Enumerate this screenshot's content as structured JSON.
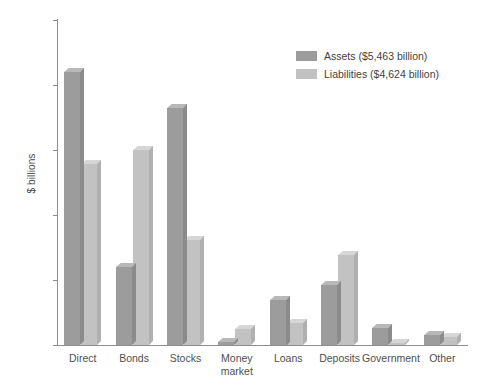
{
  "chart_data": {
    "type": "bar",
    "title": "",
    "xlabel": "",
    "ylabel": "$ billions",
    "ylim": [
      0,
      2500
    ],
    "yticks": [
      0,
      500,
      1000,
      1500,
      2000,
      2500
    ],
    "ytick_labels": [
      "0",
      "500",
      "1000",
      "1500",
      "2000",
      "2500"
    ],
    "grid": false,
    "legend_position": "upper-right-inside",
    "categories": [
      "Direct",
      "Bonds",
      "Stocks",
      "Money\nmarket",
      "Loans",
      "Deposits",
      "Government",
      "Other"
    ],
    "category_labels": [
      "Direct",
      "Bonds",
      "Stocks",
      "Money market",
      "Loans",
      "Deposits",
      "Government",
      "Other"
    ],
    "series": [
      {
        "name": "Assets ($5,463 billion)",
        "short_name": "Assets",
        "total": "$5,463 billion",
        "color": "#9c9c9c",
        "values": [
          2100,
          600,
          1820,
          20,
          350,
          460,
          130,
          80
        ]
      },
      {
        "name": "Liabilities ($4,624 billion)",
        "short_name": "Liabilities",
        "total": "$4,624 billion",
        "color": "#c2c2c2",
        "values": [
          1390,
          1500,
          810,
          120,
          170,
          690,
          10,
          60
        ]
      }
    ]
  }
}
